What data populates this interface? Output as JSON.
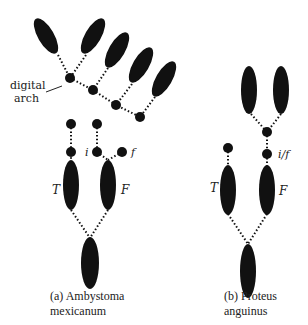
{
  "panel_a": {
    "caption_line1": "(a) Ambystoma",
    "caption_line2": "mexicanum",
    "label_digital_line1": "digital",
    "label_digital_line2": "arch",
    "label_i": "i",
    "label_f": "f",
    "label_T": "T",
    "label_F": "F"
  },
  "panel_b": {
    "caption_line1": "(b) Proteus",
    "caption_line2": "anguinus",
    "label_if": "i/f",
    "label_T": "T",
    "label_F": "F"
  },
  "colors": {
    "bone": "#111111",
    "line": "#111111",
    "text": "#222222"
  }
}
